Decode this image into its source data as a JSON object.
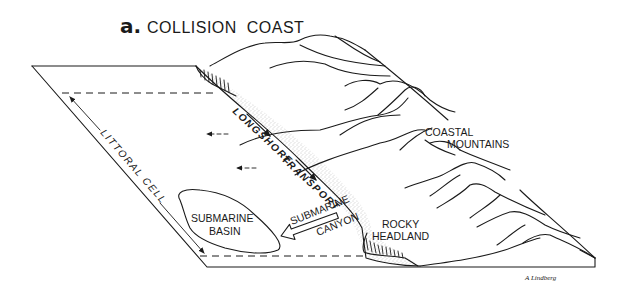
{
  "title": {
    "panel_letter": "a.",
    "text": "COLLISION  COAST"
  },
  "labels": {
    "littoral_cell": "LITTORAL CELL",
    "longshore": "LONGSHORE",
    "transport": "TRANSPORT",
    "coastal": "COASTAL",
    "mountains": "MOUNTAINS",
    "submarine_basin_1": "SUBMARINE",
    "submarine_basin_2": "BASIN",
    "submarine_canyon_1": "SUBMARINE",
    "submarine_canyon_2": "CANYON",
    "rocky": "ROCKY",
    "headland": "HEADLAND",
    "signature": "A Lindberg"
  },
  "colors": {
    "ink": "#1a1a1a",
    "stipple": "#bdbdbd",
    "background": "#ffffff"
  }
}
